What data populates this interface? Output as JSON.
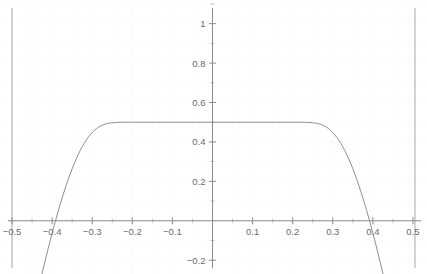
{
  "chart_data": {
    "type": "line",
    "title": "",
    "xlabel": "",
    "ylabel": "",
    "xlim": [
      -0.53,
      0.535
    ],
    "ylim": [
      -0.27,
      1.12
    ],
    "grid": true,
    "legend": null,
    "axis_style": {
      "axis_color": "#8c8c8c",
      "grid_color": "#fbfbfb",
      "curve_color": "#8f8f8f",
      "boundary_color": "#a6a6a6",
      "label_color": "#6a6a6a",
      "background": "#ffffff"
    },
    "x_ticks": [
      -0.5,
      -0.4,
      -0.3,
      -0.2,
      -0.1,
      0.1,
      0.2,
      0.3,
      0.4,
      0.5
    ],
    "x_tick_labels": [
      "−0.5",
      "−0.4",
      "−0.3",
      "−0.2",
      "−0.1",
      "0.1",
      "0.2",
      "0.3",
      "0.4",
      "0.5"
    ],
    "x_minor_ticks": [
      -0.45,
      -0.35,
      -0.25,
      -0.15,
      -0.05,
      0.05,
      0.15,
      0.25,
      0.35,
      0.45
    ],
    "y_ticks": [
      -0.2,
      0.2,
      0.4,
      0.6,
      0.8,
      1.0
    ],
    "y_tick_labels": [
      "−0.2",
      "0.2",
      "0.4",
      "0.6",
      "0.8",
      "1"
    ],
    "y_minor_ticks": [
      -0.1,
      0.1,
      0.3,
      0.5,
      0.7,
      0.9,
      1.1
    ],
    "peak_value": 0.5,
    "zero_crossings": [
      -0.412,
      0.412
    ],
    "vertical_boundaries": [
      -0.5,
      0.505
    ],
    "series": [
      {
        "name": "curve",
        "x": [
          -0.425,
          -0.42,
          -0.415,
          -0.41,
          -0.405,
          -0.4,
          -0.395,
          -0.39,
          -0.385,
          -0.38,
          -0.375,
          -0.37,
          -0.365,
          -0.36,
          -0.355,
          -0.35,
          -0.345,
          -0.34,
          -0.335,
          -0.33,
          -0.325,
          -0.32,
          -0.315,
          -0.31,
          -0.305,
          -0.3,
          -0.295,
          -0.29,
          -0.285,
          -0.28,
          -0.275,
          -0.27,
          -0.265,
          -0.26,
          -0.255,
          -0.25,
          -0.24,
          -0.23,
          -0.22,
          -0.21,
          -0.2,
          -0.18,
          -0.16,
          -0.14,
          -0.12,
          -0.1,
          -0.08,
          -0.06,
          -0.04,
          -0.02,
          0,
          0.02,
          0.04,
          0.06,
          0.08,
          0.1,
          0.12,
          0.14,
          0.16,
          0.18,
          0.2,
          0.21,
          0.22,
          0.23,
          0.24,
          0.25,
          0.255,
          0.26,
          0.265,
          0.27,
          0.275,
          0.28,
          0.285,
          0.29,
          0.295,
          0.3,
          0.305,
          0.31,
          0.315,
          0.32,
          0.325,
          0.33,
          0.335,
          0.34,
          0.345,
          0.35,
          0.355,
          0.36,
          0.365,
          0.37,
          0.375,
          0.38,
          0.385,
          0.39,
          0.395,
          0.4,
          0.405,
          0.41,
          0.415,
          0.42,
          0.425
        ],
        "y": [
          -0.268,
          -0.225,
          -0.183,
          -0.142,
          -0.102,
          -0.063,
          -0.025,
          0.012,
          0.048,
          0.083,
          0.116,
          0.148,
          0.179,
          0.209,
          0.237,
          0.264,
          0.289,
          0.313,
          0.335,
          0.356,
          0.375,
          0.393,
          0.409,
          0.423,
          0.436,
          0.448,
          0.458,
          0.467,
          0.474,
          0.48,
          0.485,
          0.489,
          0.492,
          0.494,
          0.496,
          0.497,
          0.499,
          0.4995,
          0.4998,
          0.4999,
          0.5,
          0.5,
          0.5,
          0.5,
          0.5,
          0.5,
          0.5,
          0.5,
          0.5,
          0.5,
          0.5,
          0.5,
          0.5,
          0.5,
          0.5,
          0.5,
          0.5,
          0.5,
          0.5,
          0.5,
          0.5,
          0.4999,
          0.4998,
          0.4995,
          0.499,
          0.497,
          0.496,
          0.494,
          0.492,
          0.489,
          0.485,
          0.48,
          0.474,
          0.467,
          0.458,
          0.448,
          0.436,
          0.423,
          0.409,
          0.393,
          0.375,
          0.356,
          0.335,
          0.313,
          0.289,
          0.264,
          0.237,
          0.209,
          0.179,
          0.148,
          0.116,
          0.083,
          0.048,
          0.012,
          -0.025,
          -0.063,
          -0.102,
          -0.142,
          -0.183,
          -0.225,
          -0.268
        ]
      }
    ]
  }
}
